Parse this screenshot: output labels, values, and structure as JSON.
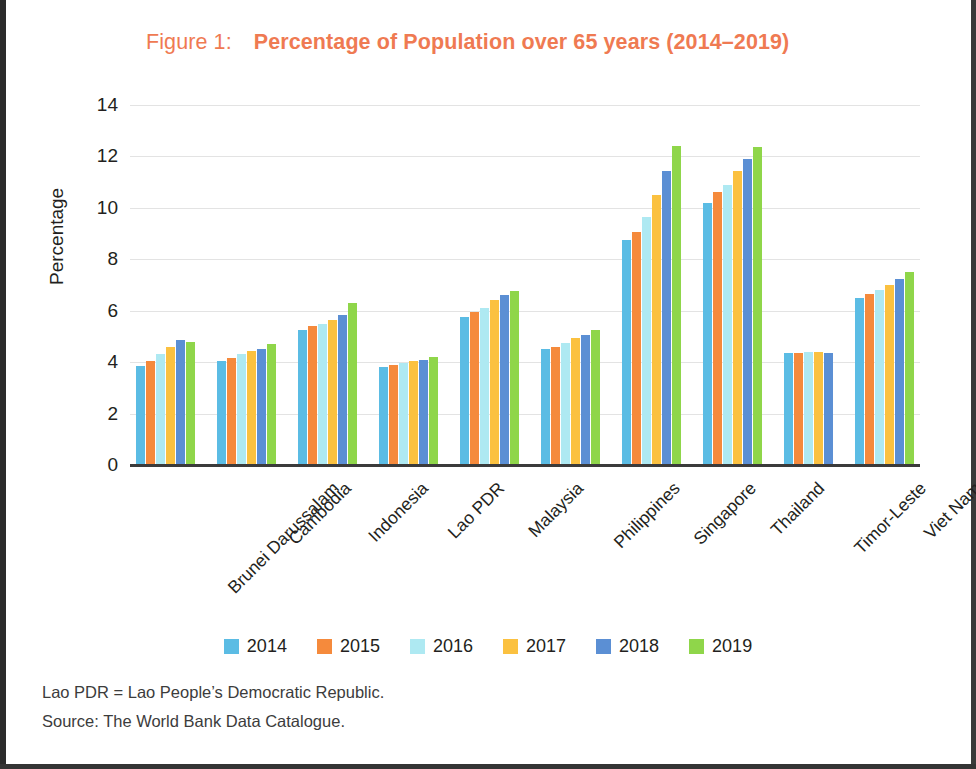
{
  "figure": {
    "number_label": "Figure 1:",
    "title": "Percentage of Population over 65 years (2014–2019)",
    "title_color": "#EF7A52"
  },
  "notes": {
    "abbreviation": "Lao PDR = Lao People’s Democratic Republic.",
    "source": "Source: The World Bank Data Catalogue."
  },
  "legend": {
    "position": "bottom-center",
    "items": [
      {
        "label": "2014",
        "color": "#5BBCE4"
      },
      {
        "label": "2015",
        "color": "#F58A3C"
      },
      {
        "label": "2016",
        "color": "#AEE9F2"
      },
      {
        "label": "2017",
        "color": "#FBC140"
      },
      {
        "label": "2018",
        "color": "#5B8FD4"
      },
      {
        "label": "2019",
        "color": "#8FD64A"
      }
    ]
  },
  "chart_data": {
    "type": "bar",
    "title": "Percentage of Population over 65 years (2014–2019)",
    "xlabel": "",
    "ylabel": "Percentage",
    "ylim": [
      0,
      14
    ],
    "yticks": [
      0,
      2,
      4,
      6,
      8,
      10,
      12,
      14
    ],
    "ytick_labels": [
      "0",
      "2",
      "4",
      "6",
      "8",
      "10",
      "12",
      "14"
    ],
    "grid": true,
    "grid_axis": "y",
    "legend_position": "bottom-center",
    "categories": [
      "Brunei Darussalam",
      "Cambodia",
      "Indonesia",
      "Lao PDR",
      "Malaysia",
      "Philippines",
      "Singapore",
      "Thailand",
      "Timor-Leste",
      "Viet Nam"
    ],
    "series": [
      {
        "name": "2014",
        "color": "#5BBCE4",
        "values": [
          3.85,
          4.05,
          5.25,
          3.8,
          5.75,
          4.5,
          8.75,
          10.2,
          4.35,
          6.5
        ]
      },
      {
        "name": "2015",
        "color": "#F58A3C",
        "values": [
          4.05,
          4.15,
          5.4,
          3.9,
          5.95,
          4.6,
          9.05,
          10.6,
          4.35,
          6.65
        ]
      },
      {
        "name": "2016",
        "color": "#AEE9F2",
        "values": [
          4.3,
          4.3,
          5.5,
          3.95,
          6.1,
          4.75,
          9.65,
          10.9,
          4.4,
          6.8
        ]
      },
      {
        "name": "2017",
        "color": "#FBC140",
        "values": [
          4.6,
          4.45,
          5.65,
          4.05,
          6.4,
          4.95,
          10.5,
          11.45,
          4.4,
          7.0
        ]
      },
      {
        "name": "2018",
        "color": "#5B8FD4",
        "values": [
          4.85,
          4.5,
          5.85,
          4.1,
          6.6,
          5.05,
          11.45,
          11.9,
          4.35,
          7.25
        ]
      },
      {
        "name": "2019",
        "color": "#8FD64A",
        "values": [
          4.8,
          4.7,
          6.3,
          4.2,
          6.75,
          5.25,
          12.4,
          12.35,
          null,
          7.5
        ]
      }
    ]
  }
}
